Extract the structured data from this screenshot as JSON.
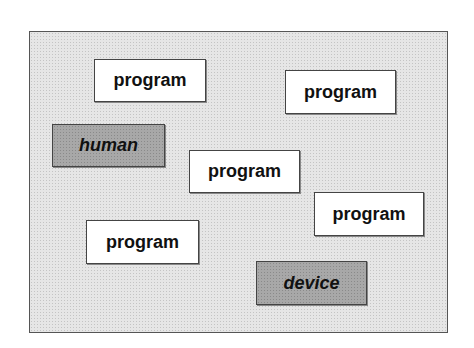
{
  "diagram": {
    "nodes": [
      {
        "id": "program-1",
        "label": "program",
        "kind": "program"
      },
      {
        "id": "program-2",
        "label": "program",
        "kind": "program"
      },
      {
        "id": "human",
        "label": "human",
        "kind": "actor"
      },
      {
        "id": "program-3",
        "label": "program",
        "kind": "program"
      },
      {
        "id": "program-4",
        "label": "program",
        "kind": "program"
      },
      {
        "id": "program-5",
        "label": "program",
        "kind": "program"
      },
      {
        "id": "device",
        "label": "device",
        "kind": "actor"
      }
    ],
    "colors": {
      "background": "#e6e6e6",
      "program_fill": "#ffffff",
      "actor_fill": "#a8a8a8",
      "border": "#444444"
    }
  }
}
